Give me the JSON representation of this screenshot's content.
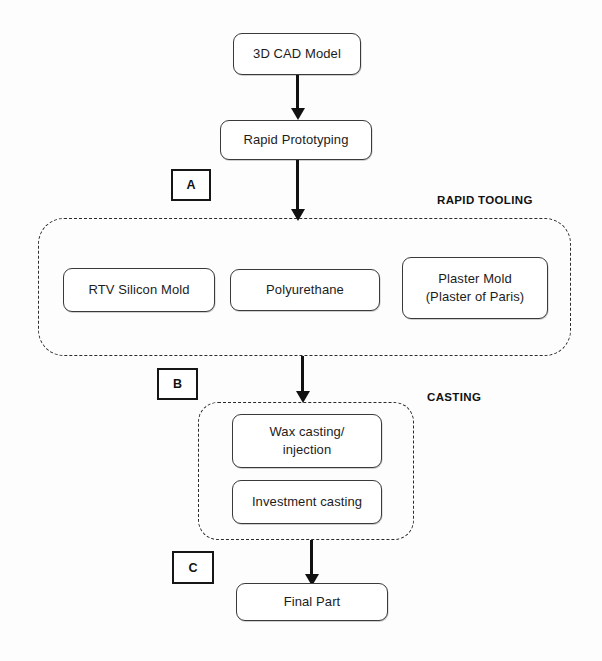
{
  "diagram": {
    "title_visible": false,
    "background_color": "#fdfdfd",
    "line_color": "#111111",
    "box_border_color": "#3a3a3a",
    "nodes": [
      {
        "id": "cad",
        "label": "3D CAD Model"
      },
      {
        "id": "rp",
        "label": "Rapid Prototyping"
      },
      {
        "id": "rtv",
        "label": "RTV Silicon Mold"
      },
      {
        "id": "pu",
        "label": "Polyurethane"
      },
      {
        "id": "plaster",
        "label": "Plaster Mold\n(Plaster of Paris)"
      },
      {
        "id": "wax",
        "label": "Wax casting/\ninjection"
      },
      {
        "id": "investment",
        "label": "Investment casting"
      },
      {
        "id": "final",
        "label": "Final Part"
      }
    ],
    "groups": [
      {
        "id": "rapid_tooling",
        "caption": "RAPID TOOLING"
      },
      {
        "id": "casting",
        "caption": "CASTING"
      }
    ],
    "markers": [
      {
        "id": "a",
        "label": "A"
      },
      {
        "id": "b",
        "label": "B"
      },
      {
        "id": "c",
        "label": "C"
      }
    ],
    "connectors": [
      {
        "id": "cad-to-rp",
        "from": "3D CAD Model",
        "to": "Rapid Prototyping",
        "arrowhead": true
      },
      {
        "id": "rp-to-rapid-tooling",
        "from": "Rapid Prototyping",
        "to": "RAPID TOOLING",
        "arrowhead": true
      },
      {
        "id": "tooling-to-casting",
        "from": "RAPID TOOLING",
        "to": "CASTING",
        "arrowhead": true
      },
      {
        "id": "casting-to-final",
        "from": "CASTING",
        "to": "Final Part",
        "arrowhead": true
      }
    ]
  }
}
